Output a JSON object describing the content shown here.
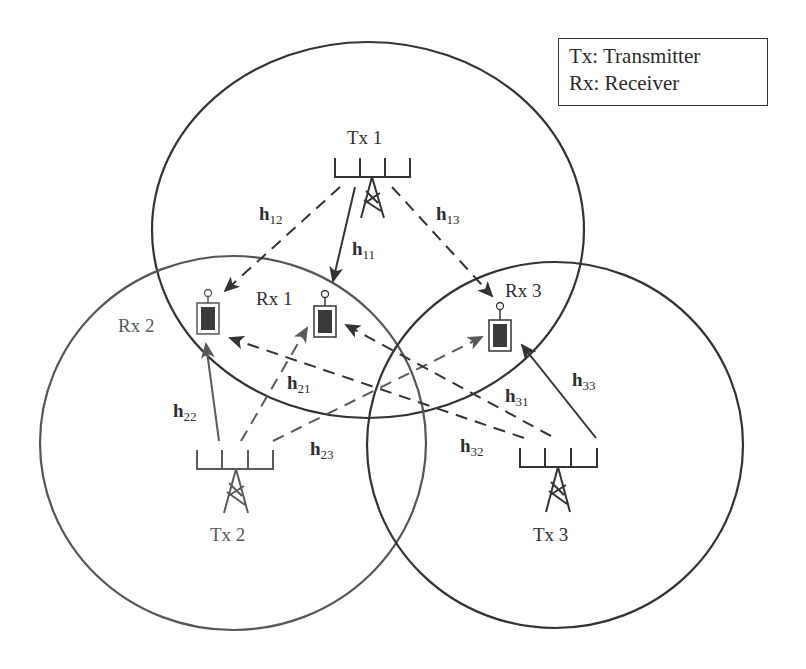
{
  "legend": {
    "line1": "Tx: Transmitter",
    "line2": "Rx: Receiver"
  },
  "transmitters": [
    {
      "id": "tx1",
      "label": "Tx 1",
      "color": "#333333"
    },
    {
      "id": "tx2",
      "label": "Tx 2",
      "color": "#5a5a5a"
    },
    {
      "id": "tx3",
      "label": "Tx 3",
      "color": "#333333"
    }
  ],
  "receivers": [
    {
      "id": "rx1",
      "label": "Rx 1",
      "color": "#333333"
    },
    {
      "id": "rx2",
      "label": "Rx 2",
      "color": "#5a5a5a"
    },
    {
      "id": "rx3",
      "label": "Rx 3",
      "color": "#333333"
    }
  ],
  "channels": {
    "h11": {
      "base": "h",
      "sub": "11",
      "type": "direct"
    },
    "h12": {
      "base": "h",
      "sub": "12",
      "type": "interference"
    },
    "h13": {
      "base": "h",
      "sub": "13",
      "type": "interference"
    },
    "h21": {
      "base": "h",
      "sub": "21",
      "type": "interference"
    },
    "h22": {
      "base": "h",
      "sub": "22",
      "type": "direct"
    },
    "h23": {
      "base": "h",
      "sub": "23",
      "type": "interference"
    },
    "h31": {
      "base": "h",
      "sub": "31",
      "type": "interference"
    },
    "h32": {
      "base": "h",
      "sub": "32",
      "type": "interference"
    },
    "h33": {
      "base": "h",
      "sub": "33",
      "type": "direct"
    }
  },
  "colors": {
    "dark": "#333333",
    "gray": "#5a5a5a",
    "device_fill": "#3a3a3a"
  }
}
